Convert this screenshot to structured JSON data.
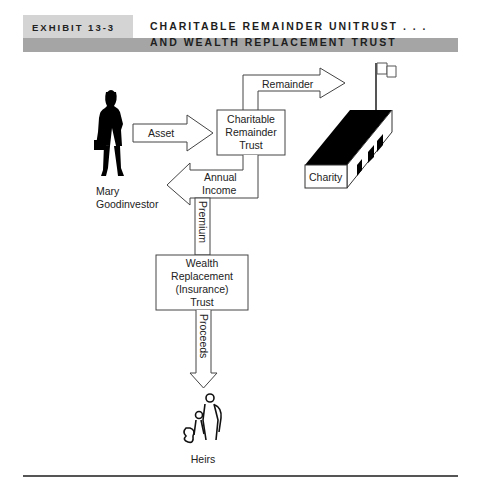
{
  "header": {
    "exhibit_label": "EXHIBIT 13-3",
    "title_line1": "CHARITABLE REMAINDER UNITRUST . . .",
    "title_line2": "AND WEALTH REPLACEMENT TRUST"
  },
  "nodes": {
    "investor": {
      "line1": "Mary",
      "line2": "Goodinvestor",
      "icon": "woman-silhouette-icon"
    },
    "crt": {
      "line1": "Charitable",
      "line2": "Remainder",
      "line3": "Trust"
    },
    "charity": {
      "label": "Charity",
      "icon": "building-with-flag-icon"
    },
    "wrt": {
      "line1": "Wealth",
      "line2": "Replacement",
      "line3": "(Insurance)",
      "line4": "Trust"
    },
    "heirs": {
      "label": "Heirs",
      "icon": "family-icon"
    }
  },
  "flows": {
    "asset": "Asset",
    "remainder": "Remainder",
    "annual_income_line1": "Annual",
    "annual_income_line2": "Income",
    "premium": "Premium",
    "proceeds": "Proceeds"
  }
}
